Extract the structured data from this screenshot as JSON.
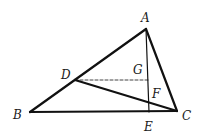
{
  "diagram": {
    "type": "geometry-triangle",
    "points": {
      "A": {
        "label": "A",
        "x": 146,
        "y": 29,
        "lx": 141,
        "ly": 22
      },
      "B": {
        "label": "B",
        "x": 30,
        "y": 112,
        "lx": 13,
        "ly": 119
      },
      "C": {
        "label": "C",
        "x": 177,
        "y": 111,
        "lx": 182,
        "ly": 120
      },
      "D": {
        "label": "D",
        "x": 75,
        "y": 80,
        "lx": 61,
        "ly": 79
      },
      "E": {
        "label": "E",
        "x": 149,
        "y": 112,
        "lx": 144,
        "ly": 131
      },
      "F": {
        "label": "F",
        "x": 148,
        "y": 99,
        "lx": 152,
        "ly": 98
      },
      "G": {
        "label": "G",
        "x": 148,
        "y": 80,
        "lx": 133,
        "ly": 74
      }
    },
    "segments": [
      {
        "from": "A",
        "to": "B",
        "style": "solid"
      },
      {
        "from": "A",
        "to": "C",
        "style": "solid"
      },
      {
        "from": "B",
        "to": "C",
        "style": "solid"
      },
      {
        "from": "A",
        "to": "E",
        "style": "solid"
      },
      {
        "from": "D",
        "to": "C",
        "style": "solid"
      },
      {
        "from": "D",
        "to": "G",
        "style": "dashed"
      }
    ],
    "labels": [
      "A",
      "B",
      "C",
      "D",
      "E",
      "F",
      "G"
    ]
  }
}
